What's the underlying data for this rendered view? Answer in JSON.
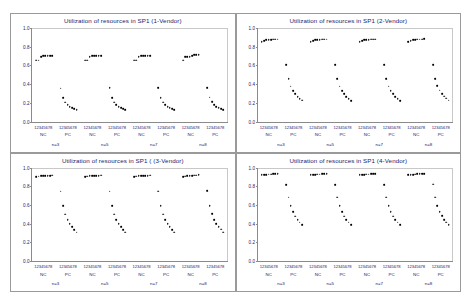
{
  "figure": {
    "name": "utilization-of-resources-sp1-panels",
    "background": "#ffffff",
    "text_color": "#1a1a6e",
    "marker_color": "#000000",
    "border_color": "#9a9a9a"
  },
  "panels": [
    {
      "id": "panel-1-vendor",
      "title": "Utilization of resources in SP1 (1-Vendor)"
    },
    {
      "id": "panel-2-vendor",
      "title": "Utilization of resources in SP1 (2-Vendor)"
    },
    {
      "id": "panel-3-vendor",
      "title": "Utilization of resources in SP1 ( (3-Vendor)"
    },
    {
      "id": "panel-4-vendor",
      "title": "Utilization of resources in SP1 (4-Vendor)"
    }
  ],
  "axis": {
    "yticks": [
      "1.0",
      "0.8",
      "0.6",
      "0.4",
      "0.2",
      "0.0"
    ],
    "ytick_values": [
      1.0,
      0.8,
      0.6,
      0.4,
      0.2,
      0.0
    ],
    "ylim": [
      0.0,
      1.0
    ],
    "xtick_group_label": "12345678",
    "xcategories": [
      "NC",
      "PC",
      "NC",
      "PC",
      "NC",
      "PC",
      "NC",
      "PC"
    ],
    "xgroups": [
      "n=3",
      "n=5",
      "n=7",
      "n=8"
    ],
    "points_per_group": 8,
    "n_groups": 8
  },
  "chart_data": {
    "type": "scatter",
    "xlabel": "",
    "ylabel": "Utilization",
    "ylim": [
      0.0,
      1.0
    ],
    "grid": false,
    "legend": "none",
    "x_tick_labels": [
      "12345678",
      "12345678",
      "12345678",
      "12345678",
      "12345678",
      "12345678",
      "12345678",
      "12345678"
    ],
    "x_category_labels": [
      "NC",
      "PC",
      "NC",
      "PC",
      "NC",
      "PC",
      "NC",
      "PC"
    ],
    "x_super_groups": [
      "n=3",
      "n=5",
      "n=7",
      "n=8"
    ],
    "panels": [
      {
        "name": "1-Vendor",
        "title": "Utilization of resources in SP1 (1-Vendor)",
        "series": [
          {
            "name": "NC n=3",
            "x": [
              1,
              2,
              3,
              4,
              5,
              6,
              7,
              8
            ],
            "values": [
              0.655,
              0.655,
              0.695,
              0.7,
              0.7,
              0.7,
              0.7,
              0.7
            ]
          },
          {
            "name": "PC n=3",
            "x": [
              1,
              2,
              3,
              4,
              5,
              6,
              7,
              8
            ],
            "values": [
              0.355,
              0.25,
              0.205,
              0.178,
              0.158,
              0.145,
              0.138,
              0.128
            ]
          },
          {
            "name": "NC n=5",
            "x": [
              1,
              2,
              3,
              4,
              5,
              6,
              7,
              8
            ],
            "values": [
              0.655,
              0.655,
              0.695,
              0.7,
              0.7,
              0.7,
              0.7,
              0.7
            ]
          },
          {
            "name": "PC n=5",
            "x": [
              1,
              2,
              3,
              4,
              5,
              6,
              7,
              8
            ],
            "values": [
              0.358,
              0.25,
              0.205,
              0.178,
              0.158,
              0.145,
              0.136,
              0.128
            ]
          },
          {
            "name": "NC n=7",
            "x": [
              1,
              2,
              3,
              4,
              5,
              6,
              7,
              8
            ],
            "values": [
              0.655,
              0.655,
              0.695,
              0.7,
              0.7,
              0.7,
              0.7,
              0.7
            ]
          },
          {
            "name": "PC n=7",
            "x": [
              1,
              2,
              3,
              4,
              5,
              6,
              7,
              8
            ],
            "values": [
              0.358,
              0.252,
              0.205,
              0.178,
              0.158,
              0.145,
              0.136,
              0.126
            ]
          },
          {
            "name": "NC n=8",
            "x": [
              1,
              2,
              3,
              4,
              5,
              6,
              7,
              8
            ],
            "values": [
              0.655,
              0.69,
              0.69,
              0.69,
              0.7,
              0.715,
              0.715,
              0.715
            ]
          },
          {
            "name": "PC n=8",
            "x": [
              1,
              2,
              3,
              4,
              5,
              6,
              7,
              8
            ],
            "values": [
              0.362,
              0.258,
              0.21,
              0.18,
              0.16,
              0.148,
              0.138,
              0.128
            ]
          }
        ]
      },
      {
        "name": "2-Vendor",
        "title": "Utilization of resources in SP1 (2-Vendor)",
        "series": [
          {
            "name": "NC n=3",
            "x": [
              1,
              2,
              3,
              4,
              5,
              6,
              7,
              8
            ],
            "values": [
              0.855,
              0.865,
              0.87,
              0.875,
              0.875,
              0.878,
              0.878,
              0.88
            ]
          },
          {
            "name": "PC n=3",
            "x": [
              1,
              2,
              3,
              4,
              5,
              6,
              7,
              8
            ],
            "values": [
              0.605,
              0.455,
              0.375,
              0.33,
              0.295,
              0.265,
              0.245,
              0.225
            ]
          },
          {
            "name": "NC n=5",
            "x": [
              1,
              2,
              3,
              4,
              5,
              6,
              7,
              8
            ],
            "values": [
              0.855,
              0.865,
              0.87,
              0.875,
              0.875,
              0.878,
              0.878,
              0.88
            ]
          },
          {
            "name": "PC n=5",
            "x": [
              1,
              2,
              3,
              4,
              5,
              6,
              7,
              8
            ],
            "values": [
              0.605,
              0.455,
              0.375,
              0.33,
              0.295,
              0.265,
              0.245,
              0.222
            ]
          },
          {
            "name": "NC n=7",
            "x": [
              1,
              2,
              3,
              4,
              5,
              6,
              7,
              8
            ],
            "values": [
              0.855,
              0.865,
              0.87,
              0.875,
              0.875,
              0.878,
              0.878,
              0.88
            ]
          },
          {
            "name": "PC n=7",
            "x": [
              1,
              2,
              3,
              4,
              5,
              6,
              7,
              8
            ],
            "values": [
              0.605,
              0.455,
              0.375,
              0.33,
              0.295,
              0.265,
              0.245,
              0.222
            ]
          },
          {
            "name": "NC n=8",
            "x": [
              1,
              2,
              3,
              4,
              5,
              6,
              7,
              8
            ],
            "values": [
              0.855,
              0.865,
              0.87,
              0.875,
              0.878,
              0.88,
              0.88,
              0.882
            ]
          },
          {
            "name": "PC n=8",
            "x": [
              1,
              2,
              3,
              4,
              5,
              6,
              7,
              8
            ],
            "values": [
              0.608,
              0.458,
              0.378,
              0.332,
              0.298,
              0.268,
              0.248,
              0.228
            ]
          }
        ]
      },
      {
        "name": "3-Vendor",
        "title": "Utilization of resources in SP1 ( (3-Vendor)",
        "series": [
          {
            "name": "NC n=3",
            "x": [
              1,
              2,
              3,
              4,
              5,
              6,
              7,
              8
            ],
            "values": [
              0.9,
              0.905,
              0.908,
              0.91,
              0.91,
              0.912,
              0.912,
              0.915
            ]
          },
          {
            "name": "PC n=3",
            "x": [
              1,
              2,
              3,
              4,
              5,
              6,
              7,
              8
            ],
            "values": [
              0.745,
              0.59,
              0.5,
              0.44,
              0.4,
              0.365,
              0.335,
              0.305
            ]
          },
          {
            "name": "NC n=5",
            "x": [
              1,
              2,
              3,
              4,
              5,
              6,
              7,
              8
            ],
            "values": [
              0.9,
              0.905,
              0.908,
              0.91,
              0.91,
              0.912,
              0.912,
              0.915
            ]
          },
          {
            "name": "PC n=5",
            "x": [
              1,
              2,
              3,
              4,
              5,
              6,
              7,
              8
            ],
            "values": [
              0.745,
              0.59,
              0.5,
              0.44,
              0.4,
              0.362,
              0.335,
              0.305
            ]
          },
          {
            "name": "NC n=7",
            "x": [
              1,
              2,
              3,
              4,
              5,
              6,
              7,
              8
            ],
            "values": [
              0.9,
              0.905,
              0.908,
              0.91,
              0.91,
              0.912,
              0.912,
              0.915
            ]
          },
          {
            "name": "PC n=7",
            "x": [
              1,
              2,
              3,
              4,
              5,
              6,
              7,
              8
            ],
            "values": [
              0.745,
              0.59,
              0.5,
              0.44,
              0.4,
              0.362,
              0.335,
              0.305
            ]
          },
          {
            "name": "NC n=8",
            "x": [
              1,
              2,
              3,
              4,
              5,
              6,
              7,
              8
            ],
            "values": [
              0.9,
              0.905,
              0.908,
              0.91,
              0.912,
              0.915,
              0.915,
              0.918
            ]
          },
          {
            "name": "PC n=8",
            "x": [
              1,
              2,
              3,
              4,
              5,
              6,
              7,
              8
            ],
            "values": [
              0.748,
              0.592,
              0.502,
              0.442,
              0.4,
              0.365,
              0.338,
              0.308
            ]
          }
        ]
      },
      {
        "name": "4-Vendor",
        "title": "Utilization of resources in SP1 (4-Vendor)",
        "series": [
          {
            "name": "NC n=3",
            "x": [
              1,
              2,
              3,
              4,
              5,
              6,
              7,
              8
            ],
            "values": [
              0.918,
              0.922,
              0.925,
              0.928,
              0.928,
              0.93,
              0.93,
              0.932
            ]
          },
          {
            "name": "PC n=3",
            "x": [
              1,
              2,
              3,
              4,
              5,
              6,
              7,
              8
            ],
            "values": [
              0.818,
              0.68,
              0.59,
              0.525,
              0.478,
              0.44,
              0.412,
              0.385
            ]
          },
          {
            "name": "NC n=5",
            "x": [
              1,
              2,
              3,
              4,
              5,
              6,
              7,
              8
            ],
            "values": [
              0.918,
              0.922,
              0.925,
              0.928,
              0.928,
              0.93,
              0.93,
              0.932
            ]
          },
          {
            "name": "PC n=5",
            "x": [
              1,
              2,
              3,
              4,
              5,
              6,
              7,
              8
            ],
            "values": [
              0.818,
              0.68,
              0.59,
              0.525,
              0.478,
              0.44,
              0.412,
              0.385
            ]
          },
          {
            "name": "NC n=7",
            "x": [
              1,
              2,
              3,
              4,
              5,
              6,
              7,
              8
            ],
            "values": [
              0.918,
              0.922,
              0.925,
              0.928,
              0.928,
              0.93,
              0.93,
              0.932
            ]
          },
          {
            "name": "PC n=7",
            "x": [
              1,
              2,
              3,
              4,
              5,
              6,
              7,
              8
            ],
            "values": [
              0.818,
              0.68,
              0.59,
              0.525,
              0.478,
              0.44,
              0.412,
              0.385
            ]
          },
          {
            "name": "NC n=8",
            "x": [
              1,
              2,
              3,
              4,
              5,
              6,
              7,
              8
            ],
            "values": [
              0.918,
              0.922,
              0.925,
              0.928,
              0.93,
              0.932,
              0.932,
              0.935
            ]
          },
          {
            "name": "PC n=8",
            "x": [
              1,
              2,
              3,
              4,
              5,
              6,
              7,
              8
            ],
            "values": [
              0.82,
              0.682,
              0.592,
              0.528,
              0.48,
              0.442,
              0.415,
              0.388
            ]
          }
        ]
      }
    ]
  }
}
